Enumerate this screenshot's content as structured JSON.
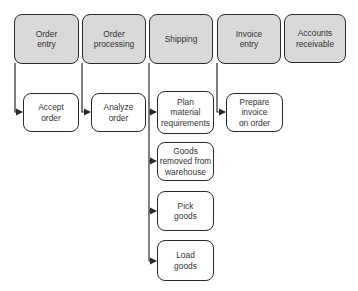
{
  "diagram": {
    "type": "process-hierarchy",
    "colors": {
      "header_fill": "#d9d9d9",
      "task_fill": "#ffffff",
      "stroke": "#2a2a2a"
    },
    "phases": [
      {
        "id": "order-entry",
        "label": "Order\nentry",
        "tasks": [
          {
            "id": "accept-order",
            "label": "Accept\norder"
          }
        ]
      },
      {
        "id": "order-processing",
        "label": "Order\nprocessing",
        "tasks": [
          {
            "id": "analyze-order",
            "label": "Analyze\norder"
          }
        ]
      },
      {
        "id": "shipping",
        "label": "Shipping",
        "tasks": [
          {
            "id": "plan-material-requirements",
            "label": "Plan\nmaterial\nrequirements"
          },
          {
            "id": "goods-removed-from-warehouse",
            "label": "Goods\nremoved from\nwarehouse"
          },
          {
            "id": "pick-goods",
            "label": "Pick\ngoods"
          },
          {
            "id": "load-goods",
            "label": "Load\ngoods"
          }
        ]
      },
      {
        "id": "invoice-entry",
        "label": "Invoice\nentry",
        "tasks": [
          {
            "id": "prepare-invoice-on-order",
            "label": "Prepare\ninvoice\non order"
          }
        ]
      },
      {
        "id": "accounts-receivable",
        "label": "Accounts\nreceivable",
        "tasks": []
      }
    ]
  }
}
